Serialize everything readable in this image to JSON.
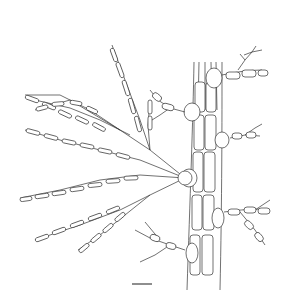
{
  "figure": {
    "type": "botanical line drawing",
    "subject": "branched filamentous alga with polysiphonous main axis",
    "background": "#ffffff",
    "line_color": "#333333",
    "scale_bar": {
      "x1": 132,
      "x2": 152,
      "y": 284,
      "label": ""
    }
  }
}
